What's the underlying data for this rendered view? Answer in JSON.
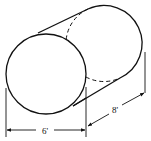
{
  "diagram": {
    "shape": "cylinder",
    "dimensions": {
      "diameter_label": "6'",
      "length_label": "8'"
    },
    "colors": {
      "stroke": "#111111",
      "background": "#ffffff"
    }
  }
}
